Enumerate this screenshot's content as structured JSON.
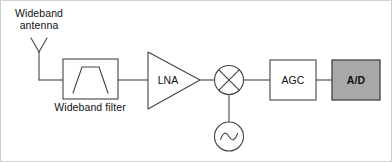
{
  "diagram": {
    "background_color": "#ffffff",
    "line_color": "#444444",
    "text_color": "#111111",
    "highlight_fill": "#a8a8a8",
    "border_color": "#bdbdbd"
  },
  "labels": {
    "antenna_line1": "Wideband",
    "antenna_line2": "antenna",
    "filter": "Wideband filter",
    "lna": "LNA",
    "agc": "AGC",
    "ad": "A/D"
  },
  "blocks": [
    {
      "id": "antenna",
      "name": "Wideband antenna",
      "shape": "dipole-v",
      "label": "Wideband antenna"
    },
    {
      "id": "filter",
      "name": "Wideband filter",
      "shape": "rect-bandpass",
      "label": "Wideband filter"
    },
    {
      "id": "lna",
      "name": "Low noise amplifier",
      "shape": "triangle",
      "label": "LNA"
    },
    {
      "id": "mixer",
      "name": "Mixer",
      "shape": "circle-cross",
      "label": ""
    },
    {
      "id": "oscillator",
      "name": "Local oscillator",
      "shape": "circle-sine",
      "label": ""
    },
    {
      "id": "agc",
      "name": "Automatic gain control",
      "shape": "rect",
      "label": "AGC"
    },
    {
      "id": "ad",
      "name": "Analog to digital converter",
      "shape": "rect-filled",
      "label": "A/D",
      "fill": "#a8a8a8"
    }
  ],
  "connections": [
    {
      "from": "antenna",
      "to": "filter"
    },
    {
      "from": "filter",
      "to": "lna"
    },
    {
      "from": "lna",
      "to": "mixer"
    },
    {
      "from": "oscillator",
      "to": "mixer"
    },
    {
      "from": "mixer",
      "to": "agc"
    },
    {
      "from": "agc",
      "to": "ad"
    }
  ]
}
